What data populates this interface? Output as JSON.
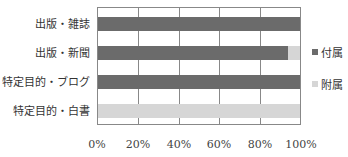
{
  "chart_data": {
    "type": "bar",
    "orientation": "horizontal",
    "stacked": "percent",
    "categories": [
      "出版・雑誌",
      "出版・新聞",
      "特定目的・ブログ",
      "特定目的・白書"
    ],
    "series": [
      {
        "name": "付属",
        "color": "#6b6b6b",
        "values": [
          100,
          94,
          100,
          0
        ]
      },
      {
        "name": "附属",
        "color": "#d6d6d6",
        "values": [
          0,
          6,
          0,
          100
        ]
      }
    ],
    "xlabel": "",
    "ylabel": "",
    "xlim": [
      0,
      100
    ],
    "xticks": [
      "0%",
      "20%",
      "40%",
      "60%",
      "80%",
      "100%"
    ],
    "grid": true,
    "legend_position": "right"
  }
}
